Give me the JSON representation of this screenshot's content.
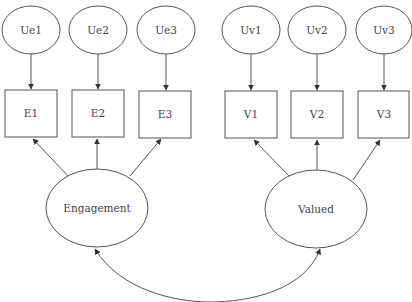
{
  "diagram": {
    "type": "structural-equation-model",
    "colors": {
      "stroke": "#555555",
      "text": "#444444",
      "background": "#ffffff"
    },
    "error_terms": [
      {
        "id": "Ue1",
        "label": "Ue1",
        "cx": 31,
        "cy": 30,
        "rx": 29,
        "ry": 24
      },
      {
        "id": "Ue2",
        "label": "Ue2",
        "cx": 98,
        "cy": 30,
        "rx": 29,
        "ry": 24
      },
      {
        "id": "Ue3",
        "label": "Ue3",
        "cx": 166,
        "cy": 30,
        "rx": 29,
        "ry": 24
      },
      {
        "id": "Uv1",
        "label": "Uv1",
        "cx": 251,
        "cy": 30,
        "rx": 29,
        "ry": 24
      },
      {
        "id": "Uv2",
        "label": "Uv2",
        "cx": 317,
        "cy": 30,
        "rx": 29,
        "ry": 24
      },
      {
        "id": "Uv3",
        "label": "Uv3",
        "cx": 384,
        "cy": 30,
        "rx": 28,
        "ry": 24
      }
    ],
    "indicators": [
      {
        "id": "E1",
        "label": "E1",
        "x": 5,
        "y": 90,
        "w": 52,
        "h": 47
      },
      {
        "id": "E2",
        "label": "E2",
        "x": 72,
        "y": 90,
        "w": 52,
        "h": 47
      },
      {
        "id": "E3",
        "label": "E3",
        "x": 139,
        "y": 91,
        "w": 52,
        "h": 47
      },
      {
        "id": "V1",
        "label": "V1",
        "x": 225,
        "y": 91,
        "w": 52,
        "h": 47
      },
      {
        "id": "V2",
        "label": "V2",
        "x": 291,
        "y": 91,
        "w": 52,
        "h": 47
      },
      {
        "id": "V3",
        "label": "V3",
        "x": 358,
        "y": 91,
        "w": 51,
        "h": 47
      }
    ],
    "latent_factors": [
      {
        "id": "Engagement",
        "label": "Engagement",
        "cx": 97,
        "cy": 208,
        "rx": 51,
        "ry": 39
      },
      {
        "id": "Valued",
        "label": "Valued",
        "cx": 316,
        "cy": 209,
        "rx": 51,
        "ry": 39
      }
    ],
    "edges": [
      {
        "from": "Ue1",
        "to": "E1",
        "kind": "directed"
      },
      {
        "from": "Ue2",
        "to": "E2",
        "kind": "directed"
      },
      {
        "from": "Ue3",
        "to": "E3",
        "kind": "directed"
      },
      {
        "from": "Uv1",
        "to": "V1",
        "kind": "directed"
      },
      {
        "from": "Uv2",
        "to": "V2",
        "kind": "directed"
      },
      {
        "from": "Uv3",
        "to": "V3",
        "kind": "directed"
      },
      {
        "from": "Engagement",
        "to": "E1",
        "kind": "directed"
      },
      {
        "from": "Engagement",
        "to": "E2",
        "kind": "directed"
      },
      {
        "from": "Engagement",
        "to": "E3",
        "kind": "directed"
      },
      {
        "from": "Valued",
        "to": "V1",
        "kind": "directed"
      },
      {
        "from": "Valued",
        "to": "V2",
        "kind": "directed"
      },
      {
        "from": "Valued",
        "to": "V3",
        "kind": "directed"
      },
      {
        "from": "Engagement",
        "to": "Valued",
        "kind": "covariance-double-headed-curve"
      }
    ]
  }
}
